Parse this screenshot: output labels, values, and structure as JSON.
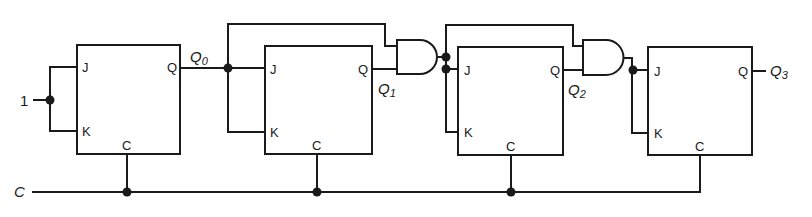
{
  "diagram": {
    "input_label": "1",
    "clock_label": "C",
    "flip_flops": [
      {
        "id": "FF0",
        "pin_j": "J",
        "pin_k": "K",
        "pin_q": "Q",
        "pin_c": "C",
        "output": "Q",
        "output_sub": "0"
      },
      {
        "id": "FF1",
        "pin_j": "J",
        "pin_k": "K",
        "pin_q": "Q",
        "pin_c": "C",
        "output": "Q",
        "output_sub": "1"
      },
      {
        "id": "FF2",
        "pin_j": "J",
        "pin_k": "K",
        "pin_q": "Q",
        "pin_c": "C",
        "output": "Q",
        "output_sub": "2"
      },
      {
        "id": "FF3",
        "pin_j": "J",
        "pin_k": "K",
        "pin_q": "Q",
        "pin_c": "C",
        "output": "Q",
        "output_sub": "3"
      }
    ],
    "gates": [
      {
        "id": "AND1",
        "type": "AND",
        "inputs": [
          "Q0",
          "Q1"
        ]
      },
      {
        "id": "AND2",
        "type": "AND",
        "inputs": [
          "AND1",
          "Q2"
        ]
      }
    ],
    "colors": {
      "line": "#1a1a1a",
      "background": "#ffffff"
    }
  }
}
